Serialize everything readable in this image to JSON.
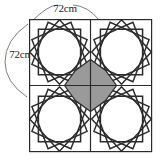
{
  "figure": {
    "kind": "geometric-diagram",
    "outer_square": {
      "x": 29,
      "y": 19,
      "width": 123,
      "height": 133,
      "stroke": "#2b2b2b",
      "stroke_width": 1.2,
      "fill": "#ffffff"
    },
    "midlines": {
      "vertical_x": 90.5,
      "horizontal_y": 85.5,
      "stroke": "#2b2b2b",
      "stroke_width": 1.2
    },
    "star": {
      "points": 8,
      "stroke": "#2b2b2b",
      "stroke_width": 1.5,
      "inner_ratio": 0.6
    },
    "center_shape": {
      "name": "shaded-octagon",
      "fill": "#9a9a9a",
      "stroke": "#2b2b2b",
      "stroke_width": 1.2,
      "radius": 26
    },
    "colors": {
      "ink": "#2b2b2b",
      "shade": "#9a9a9a",
      "paper": "#ffffff",
      "arc": "#6e6e6e"
    },
    "quadrants": [
      {
        "name": "top-left",
        "cx": 59.5,
        "cy": 52.0
      },
      {
        "name": "top-right",
        "cx": 121.5,
        "cy": 52.0
      },
      {
        "name": "bottom-left",
        "cx": 59.5,
        "cy": 119.0
      },
      {
        "name": "bottom-right",
        "cx": 121.5,
        "cy": 119.0
      }
    ]
  },
  "labels": {
    "top": {
      "text": "72cm",
      "x": 65,
      "y": 12,
      "anchor": "middle"
    },
    "left": {
      "text": "72cm",
      "x": 21,
      "y": 58,
      "anchor": "middle"
    }
  },
  "dimension_arcs": {
    "top": "M 31 22 Q 48 5 58 5",
    "top_right": "M 73 5 Q 88 6 99 20",
    "left": "M 28 24 Q 5 40 5 62 Q 5 82 27 97"
  }
}
